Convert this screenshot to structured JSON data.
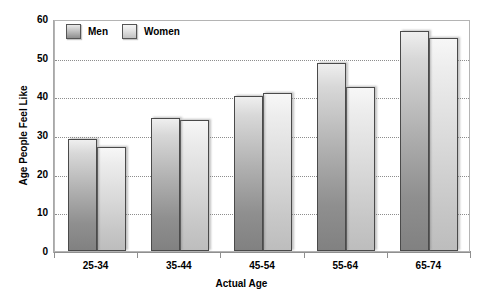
{
  "chart_data": {
    "type": "bar",
    "title": "",
    "subtitle": "",
    "xlabel": "Actual Age",
    "ylabel": "Age People Feel Like",
    "categories": [
      "25-34",
      "35-44",
      "45-54",
      "55-64",
      "65-74"
    ],
    "series": [
      {
        "name": "Men",
        "values": [
          29,
          34.5,
          40.2,
          48.5,
          57
        ]
      },
      {
        "name": "Women",
        "values": [
          26.8,
          34,
          40.8,
          42.5,
          55
        ]
      }
    ],
    "ylim": [
      0,
      60
    ],
    "ytick_values": [
      0,
      10,
      20,
      30,
      40,
      50,
      60
    ],
    "ytick_labels": [
      "0",
      "10",
      "20",
      "30",
      "40",
      "50",
      "60"
    ],
    "grid": "horizontal-dotted",
    "legend_position": "top-left-inside",
    "colors": {
      "men_top": "#efefef",
      "men_bottom": "#818181",
      "women_top": "#f7f7f7",
      "women_bottom": "#bdbdbd",
      "bar_border": "#4a4a4a",
      "gridline": "#8d8d8d",
      "frame": "#b4b4b4",
      "axis": "#8f8f8f",
      "text": "#000000",
      "background": "#ffffff"
    }
  }
}
